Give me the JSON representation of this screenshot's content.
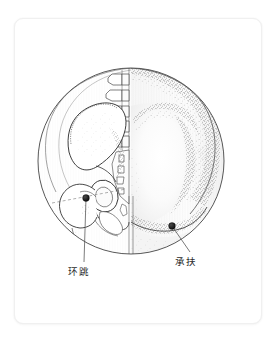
{
  "figure": {
    "type": "anatomical-acupoint-illustration",
    "region": "gluteal-hip",
    "view": "posterolateral",
    "frame": {
      "card_background": "#ffffff",
      "card_border_color": "#f0f0f0",
      "card_radius_px": 9,
      "page_background": "#ffffff"
    },
    "vignette": {
      "shape": "circle",
      "center_x": 131,
      "center_y": 161,
      "radius": 93,
      "stroke_color": "#3a3a3a",
      "stroke_width": 0.8
    },
    "halves": {
      "left_label": "skeletal-pelvis-and-lumbar-spine",
      "right_label": "stippled-skin-surface-buttock"
    },
    "ink_color": "#333333",
    "stipple_color": "#555555",
    "point_marker_color": "#111111",
    "leader_line_color": "#555555"
  },
  "acupoints": [
    {
      "id": "huantiao",
      "label": "环跳",
      "pinyin": "Huantiao",
      "code": "GB30",
      "marker_x": 86,
      "marker_y": 198,
      "marker_radius": 3.4,
      "leader_end_x": 84,
      "leader_end_y": 262,
      "label_x": 79,
      "label_y": 275
    },
    {
      "id": "chengfu",
      "label": "承扶",
      "pinyin": "Chengfu",
      "code": "BL36",
      "marker_x": 172,
      "marker_y": 226,
      "marker_radius": 3.4,
      "leader_end_x": 190,
      "leader_end_y": 252,
      "label_x": 186,
      "label_y": 265
    }
  ]
}
